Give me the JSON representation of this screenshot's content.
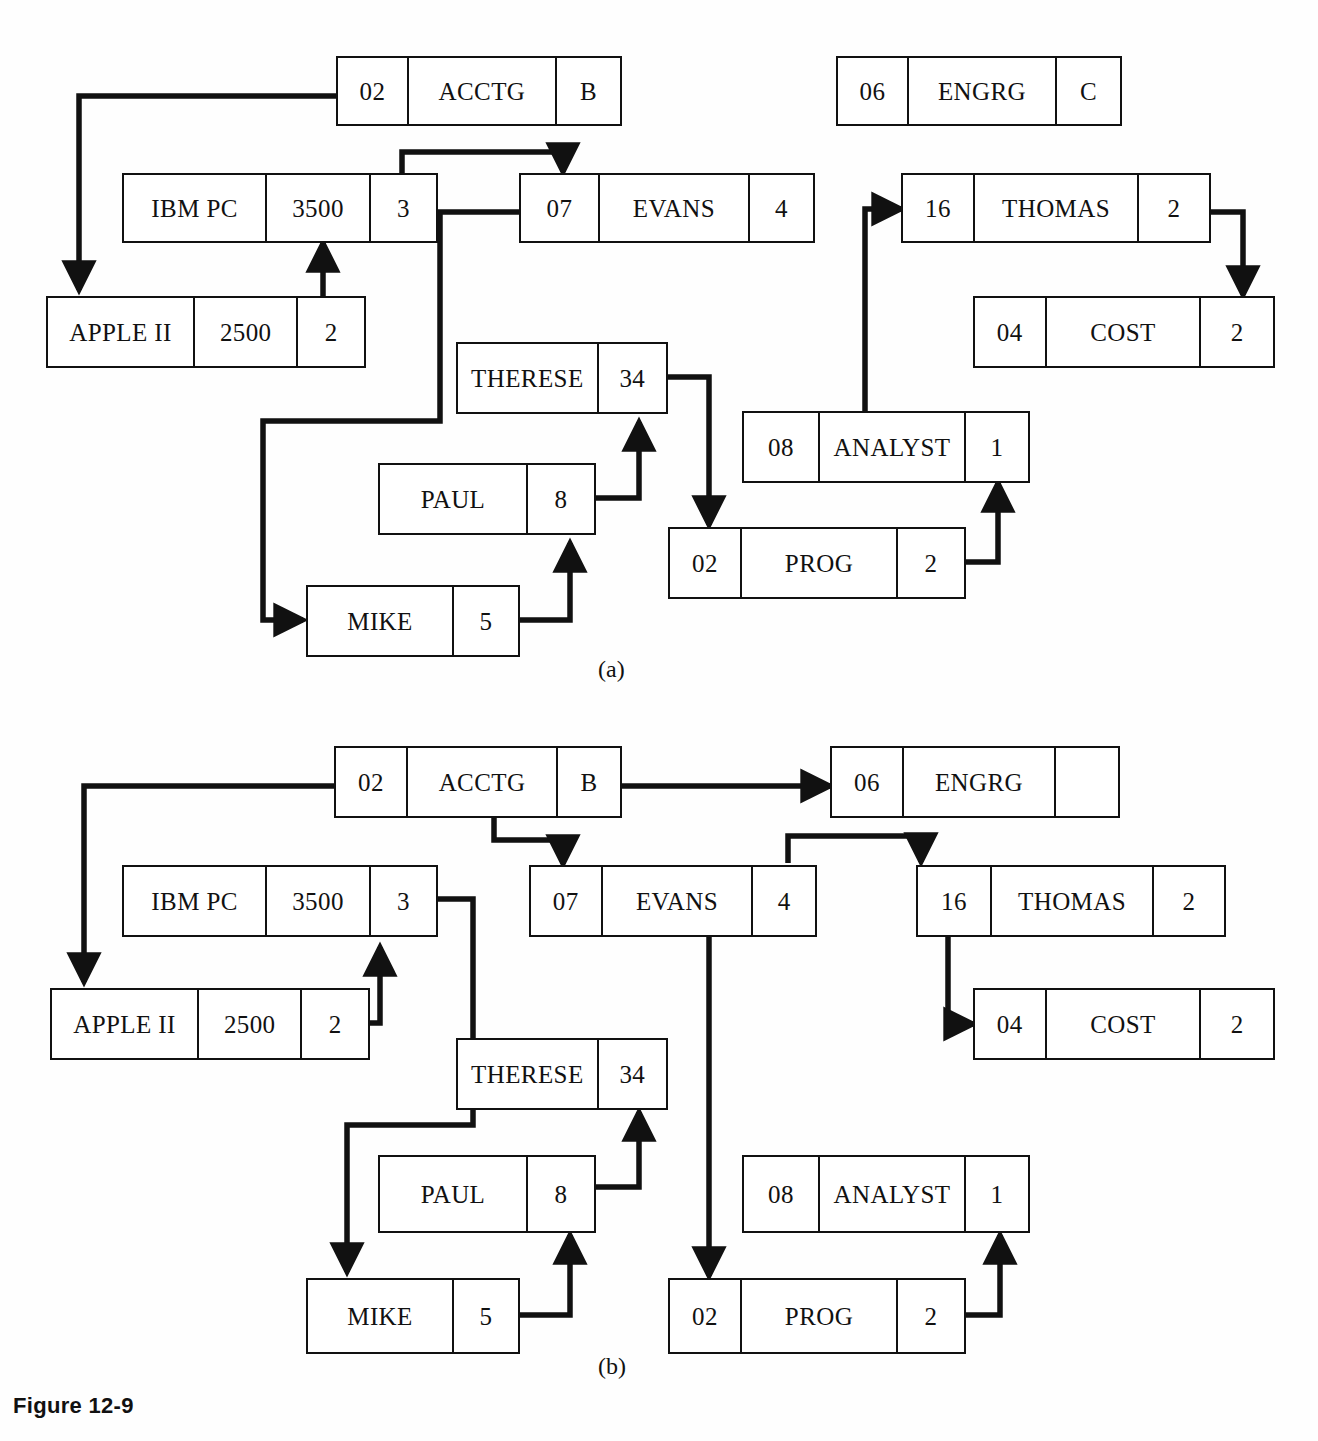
{
  "figure": {
    "caption": "Figure 12-9",
    "panels": [
      {
        "id": "a",
        "label": "(a)"
      },
      {
        "id": "b",
        "label": "(b)"
      }
    ]
  },
  "panel_a": {
    "label": "(a)",
    "records": [
      {
        "name": "acctg-record",
        "cells": [
          "02",
          "ACCTG",
          "B"
        ]
      },
      {
        "name": "engrg-record",
        "cells": [
          "06",
          "ENGRG",
          "C"
        ]
      },
      {
        "name": "ibmpc-record",
        "cells": [
          "IBM PC",
          "3500",
          "3"
        ]
      },
      {
        "name": "evans-record",
        "cells": [
          "07",
          "EVANS",
          "4"
        ]
      },
      {
        "name": "thomas-record",
        "cells": [
          "16",
          "THOMAS",
          "2"
        ]
      },
      {
        "name": "appleii-record",
        "cells": [
          "APPLE II",
          "2500",
          "2"
        ]
      },
      {
        "name": "cost-record",
        "cells": [
          "04",
          "COST",
          "2"
        ]
      },
      {
        "name": "therese-record",
        "cells": [
          "THERESE",
          "34"
        ]
      },
      {
        "name": "analyst-record",
        "cells": [
          "08",
          "ANALYST",
          "1"
        ]
      },
      {
        "name": "paul-record",
        "cells": [
          "PAUL",
          "8"
        ]
      },
      {
        "name": "prog-record",
        "cells": [
          "02",
          "PROG",
          "2"
        ]
      },
      {
        "name": "mike-record",
        "cells": [
          "MIKE",
          "5"
        ]
      }
    ]
  },
  "panel_b": {
    "label": "(b)",
    "records": [
      {
        "name": "acctg-record",
        "cells": [
          "02",
          "ACCTG",
          "B"
        ]
      },
      {
        "name": "engrg-record",
        "cells": [
          "06",
          "ENGRG",
          ""
        ]
      },
      {
        "name": "ibmpc-record",
        "cells": [
          "IBM PC",
          "3500",
          "3"
        ]
      },
      {
        "name": "evans-record",
        "cells": [
          "07",
          "EVANS",
          "4"
        ]
      },
      {
        "name": "thomas-record",
        "cells": [
          "16",
          "THOMAS",
          "2"
        ]
      },
      {
        "name": "appleii-record",
        "cells": [
          "APPLE II",
          "2500",
          "2"
        ]
      },
      {
        "name": "cost-record",
        "cells": [
          "04",
          "COST",
          "2"
        ]
      },
      {
        "name": "therese-record",
        "cells": [
          "THERESE",
          "34"
        ]
      },
      {
        "name": "analyst-record",
        "cells": [
          "08",
          "ANALYST",
          "1"
        ]
      },
      {
        "name": "paul-record",
        "cells": [
          "PAUL",
          "8"
        ]
      },
      {
        "name": "prog-record",
        "cells": [
          "02",
          "PROG",
          "2"
        ]
      },
      {
        "name": "mike-record",
        "cells": [
          "MIKE",
          "5"
        ]
      }
    ]
  },
  "colors": {
    "ink": "#111111",
    "paper": "#fefefe"
  }
}
